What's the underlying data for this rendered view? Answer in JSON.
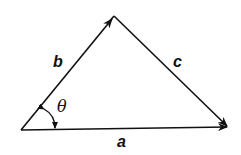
{
  "diagram": {
    "type": "vector-triangle",
    "labels": {
      "a": "a",
      "b": "b",
      "c": "c",
      "angle": "θ"
    },
    "vectors": [
      {
        "name": "b",
        "from": "origin",
        "to": "apex"
      },
      {
        "name": "c",
        "from": "apex",
        "to": "right-vertex"
      },
      {
        "name": "a",
        "from": "origin",
        "to": "right-vertex"
      }
    ],
    "colors": {
      "stroke": "#111111",
      "background": "#ffffff"
    }
  }
}
